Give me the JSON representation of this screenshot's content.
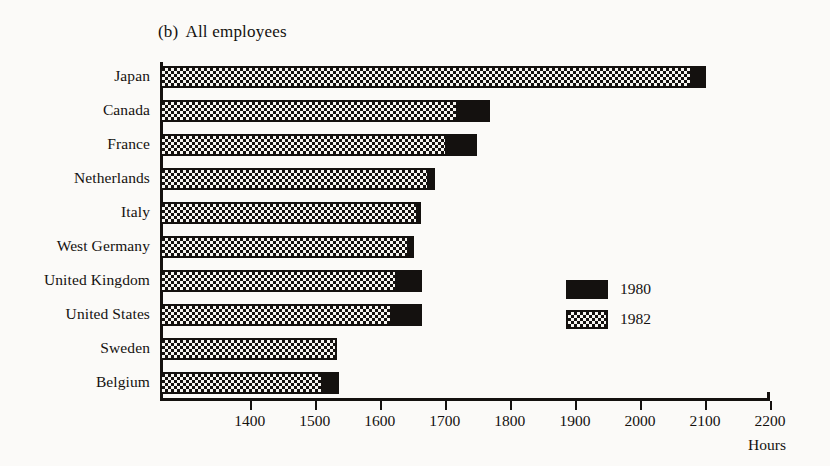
{
  "chart_data": {
    "type": "bar",
    "orientation": "horizontal",
    "title_number": "(b)",
    "title_text": "All employees",
    "xlabel": "Hours",
    "ylabel": "",
    "xlim": [
      1262,
      2200
    ],
    "xticks": [
      1400,
      1500,
      1600,
      1700,
      1800,
      1900,
      2000,
      2100,
      2200
    ],
    "xtick_labels": [
      "1400",
      "1500",
      "1600",
      "1700",
      "1800",
      "1900",
      "2000",
      "2100",
      "2200"
    ],
    "grid": false,
    "legend_position": "center-right",
    "categories": [
      "Japan",
      "Canada",
      "France",
      "Netherlands",
      "Italy",
      "West Germany",
      "United Kingdom",
      "United States",
      "Sweden",
      "Belgium"
    ],
    "series": [
      {
        "name": "1980",
        "fill": "solid-black",
        "color": "#14110f",
        "values": [
          2102,
          1770,
          1750,
          1685,
          1664,
          1653,
          1665,
          1665,
          1534,
          1538
        ]
      },
      {
        "name": "1982",
        "fill": "checkerboard",
        "color": "#14110f",
        "values": [
          2080,
          1720,
          1703,
          1675,
          1658,
          1645,
          1626,
          1619,
          1534,
          1512
        ]
      }
    ]
  },
  "legend": {
    "entries": [
      {
        "label": "1980",
        "swatch": "solid-black"
      },
      {
        "label": "1982",
        "swatch": "checkerboard"
      }
    ]
  }
}
